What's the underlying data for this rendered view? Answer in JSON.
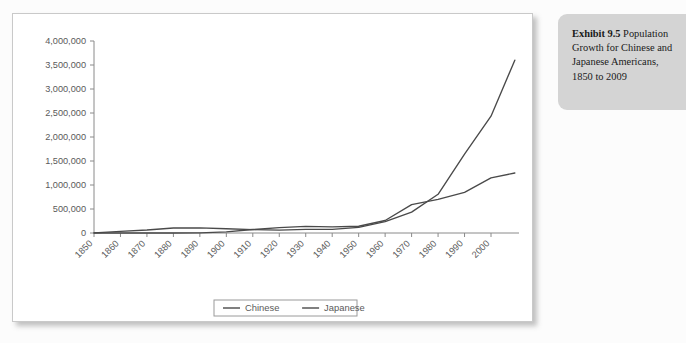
{
  "caption": {
    "lead": "Exhibit 9.5",
    "body": " Population Growth for Chinese and Japanese Americans, 1850 to 2009"
  },
  "colors": {
    "panel_bg": "#ffffff",
    "panel_border": "#c9c9c9",
    "caption_bg": "#d4d4d4",
    "line": "#4a4a4a",
    "axis": "#8a8a8a",
    "tick_text": "#5a5a5a"
  },
  "chart_data": {
    "type": "line",
    "title": "",
    "subtitle": "",
    "xlabel": "",
    "ylabel": "",
    "grid": false,
    "legend_position": "bottom",
    "xlim": [
      1850,
      2009
    ],
    "ylim": [
      0,
      4000000
    ],
    "ytick_labels": [
      "4,000,000",
      "3,500,000",
      "3,000,000",
      "2,500,000",
      "2,000,000",
      "1,500,000",
      "1,000,000",
      "500,000",
      "0"
    ],
    "ytick_values": [
      4000000,
      3500000,
      3000000,
      2500000,
      2000000,
      1500000,
      1000000,
      500000,
      0
    ],
    "xtick_labels": [
      "1850",
      "1860",
      "1870",
      "1880",
      "1890",
      "1900",
      "1910",
      "1920",
      "1930",
      "1940",
      "1950",
      "1960",
      "1970",
      "1980",
      "1990",
      "2000"
    ],
    "xtick_values": [
      1850,
      1860,
      1870,
      1880,
      1890,
      1900,
      1910,
      1920,
      1930,
      1940,
      1950,
      1960,
      1970,
      1980,
      1990,
      2000
    ],
    "x": [
      1850,
      1860,
      1870,
      1880,
      1890,
      1900,
      1910,
      1920,
      1930,
      1940,
      1950,
      1960,
      1970,
      1980,
      1990,
      2000,
      2009
    ],
    "series": [
      {
        "name": "Chinese",
        "values": [
          4000,
          35000,
          63000,
          105000,
          107000,
          89000,
          71000,
          61000,
          75000,
          77000,
          117000,
          237000,
          435000,
          806000,
          1645000,
          2433000,
          3600000
        ]
      },
      {
        "name": "Japanese",
        "values": [
          0,
          0,
          55,
          148,
          2039,
          24000,
          72000,
          111000,
          138000,
          127000,
          141000,
          260000,
          591000,
          701000,
          848000,
          1148000,
          1250000
        ]
      }
    ]
  }
}
